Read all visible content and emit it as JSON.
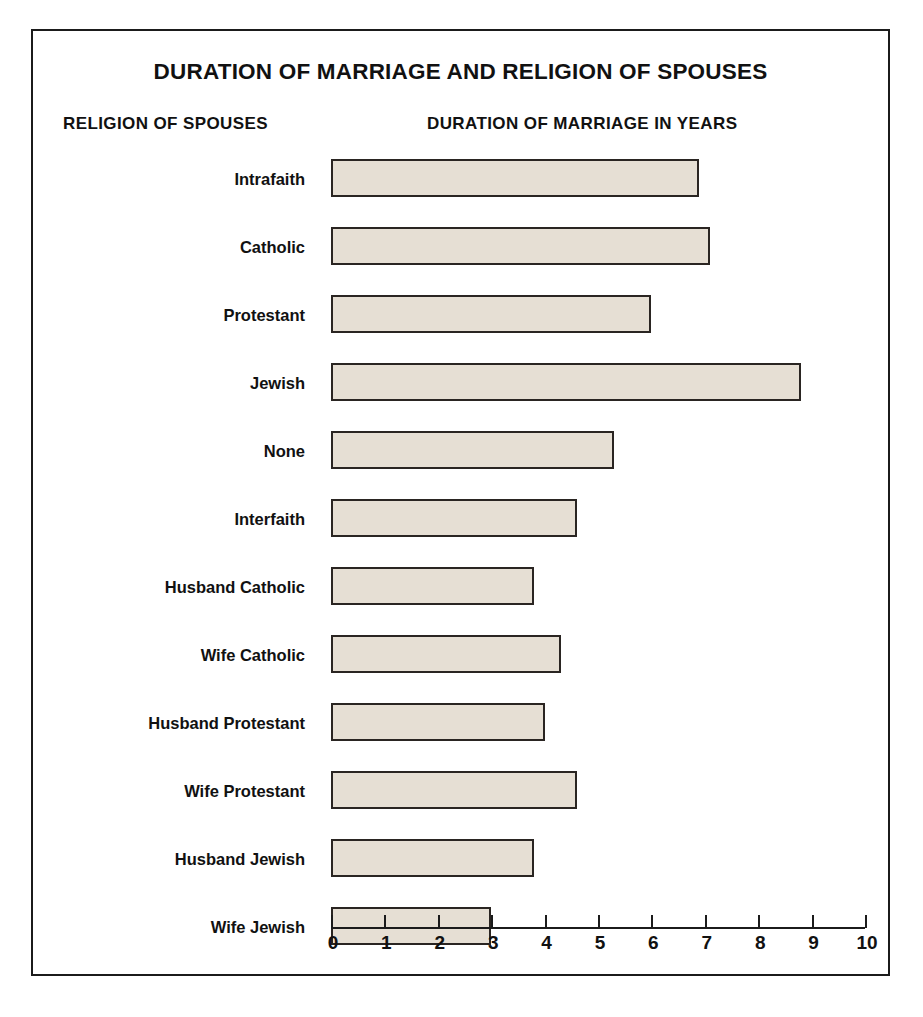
{
  "chart_data": {
    "type": "bar",
    "orientation": "horizontal",
    "title": "DURATION OF MARRIAGE AND RELIGION OF SPOUSES",
    "xlabel": "DURATION OF MARRIAGE IN YEARS",
    "ylabel": "RELIGION OF SPOUSES",
    "categories": [
      "Intrafaith",
      "Catholic",
      "Protestant",
      "Jewish",
      "None",
      "Interfaith",
      "Husband Catholic",
      "Wife Catholic",
      "Husband Protestant",
      "Wife Protestant",
      "Husband Jewish",
      "Wife Jewish"
    ],
    "values": [
      6.9,
      7.1,
      6.0,
      8.8,
      5.3,
      4.6,
      3.8,
      4.3,
      4.0,
      4.6,
      3.8,
      3.0
    ],
    "xlim": [
      0,
      10
    ],
    "xticks": [
      0,
      1,
      2,
      3,
      4,
      5,
      6,
      7,
      8,
      9,
      10
    ],
    "xtick_labels": [
      "0",
      "1",
      "2",
      "3",
      "4",
      "5",
      "6",
      "7",
      "8",
      "9",
      "10"
    ],
    "grid": false,
    "legend": null,
    "bar_fill_color": "#e6dfd4",
    "bar_border_color": "#2a2522",
    "frame_color": "#1b1b1b",
    "text_color": "#111111",
    "background_color": "#ffffff"
  }
}
